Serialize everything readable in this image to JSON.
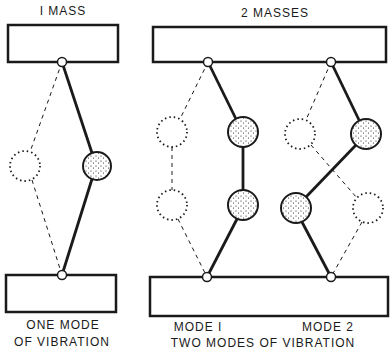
{
  "titles": {
    "one_mass": "I MASS",
    "two_masses": "2 MASSES"
  },
  "captions": {
    "one_mode_line1": "ONE MODE",
    "one_mode_line2": "OF VIBRATION",
    "mode1": "MODE I",
    "mode2": "MODE 2",
    "two_modes": "TWO MODES OF VIBRATION"
  },
  "colors": {
    "ink": "#1a1a1a",
    "background": "#ffffff"
  }
}
